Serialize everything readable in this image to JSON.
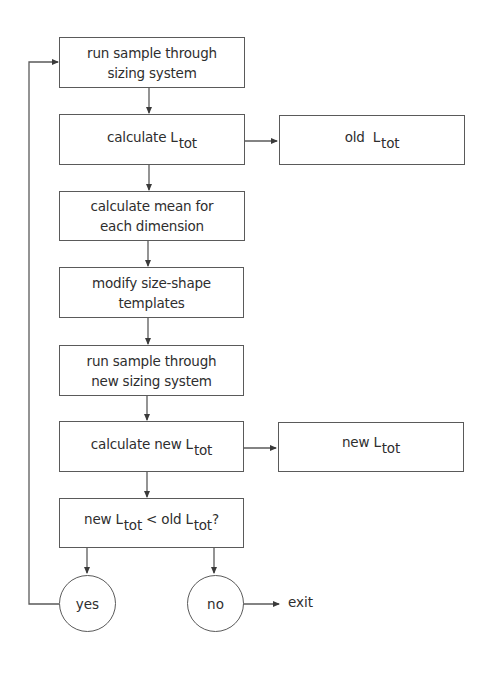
{
  "diagram": {
    "type": "flowchart",
    "colors": {
      "line": "#5a5a5a",
      "text": "#2e2e2e",
      "background": "#ffffff"
    },
    "nodes": {
      "run_sample": {
        "line1": "run sample through",
        "line2": "sizing system"
      },
      "calc_ltot": {
        "prefix": "calculate L",
        "sub": "tot"
      },
      "old_ltot": {
        "prefix": "old  L",
        "sub": "tot"
      },
      "calc_mean": {
        "line1": "calculate mean for",
        "line2": "each dimension"
      },
      "modify_templates": {
        "line1": "modify size-shape",
        "line2": "templates"
      },
      "run_new": {
        "line1": "run sample through",
        "line2": "new sizing system"
      },
      "calc_new_ltot": {
        "prefix": "calculate new L",
        "sub": "tot"
      },
      "new_ltot": {
        "prefix": "new L",
        "sub": "tot"
      },
      "decision": {
        "part1": "new L",
        "sub1": "tot",
        "part2": " < old L",
        "sub2": "tot",
        "suffix": "?"
      },
      "yes": {
        "label": "yes"
      },
      "no": {
        "label": "no"
      },
      "exit": {
        "label": "exit"
      }
    },
    "edges": [
      {
        "from": "run_sample",
        "to": "calc_ltot"
      },
      {
        "from": "calc_ltot",
        "to": "old_ltot"
      },
      {
        "from": "calc_ltot",
        "to": "calc_mean"
      },
      {
        "from": "calc_mean",
        "to": "modify_templates"
      },
      {
        "from": "modify_templates",
        "to": "run_new"
      },
      {
        "from": "run_new",
        "to": "calc_new_ltot"
      },
      {
        "from": "calc_new_ltot",
        "to": "new_ltot"
      },
      {
        "from": "calc_new_ltot",
        "to": "decision"
      },
      {
        "from": "decision",
        "to": "yes"
      },
      {
        "from": "decision",
        "to": "no"
      },
      {
        "from": "yes",
        "to": "run_sample"
      },
      {
        "from": "no",
        "to": "exit"
      }
    ]
  }
}
